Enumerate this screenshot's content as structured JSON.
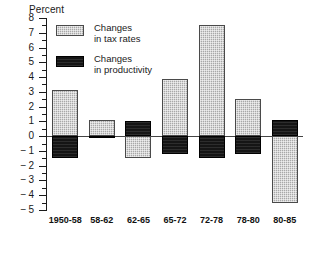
{
  "chart_data": {
    "type": "bar",
    "title": "",
    "ylabel": "Percent",
    "xlabel": "",
    "ylim": [
      -5,
      8
    ],
    "ytick_step": 1,
    "minor_ticks": true,
    "grid": false,
    "zero_line": true,
    "legend_position": "upper-left",
    "categories": [
      "1950-58",
      "58-62",
      "62-65",
      "65-72",
      "72-78",
      "78-80",
      "80-85"
    ],
    "ytick_labels": [
      "8",
      "7",
      "6",
      "5",
      "4",
      "3",
      "2",
      "1",
      "0",
      "-1",
      "-2",
      "-3",
      "-4",
      "-5"
    ],
    "series": [
      {
        "name": "Changes in tax rates",
        "color": "#a8a8a8",
        "pattern": "stipple",
        "values": [
          3.1,
          1.1,
          -1.45,
          3.9,
          7.5,
          2.5,
          -4.5
        ]
      },
      {
        "name": "Changes in productivity",
        "color": "#151515",
        "pattern": "solid",
        "values": [
          -1.45,
          -0.1,
          1.0,
          -1.2,
          -1.45,
          -1.2,
          1.1
        ]
      }
    ]
  },
  "legend": {
    "items": [
      {
        "line1": "Changes",
        "line2": "in tax rates",
        "swatch": "tax-rates-swatch"
      },
      {
        "line1": "Changes",
        "line2": "in productivity",
        "swatch": "productivity-swatch"
      }
    ]
  }
}
